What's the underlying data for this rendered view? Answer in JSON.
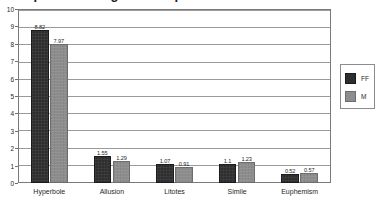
{
  "chart_data": {
    "type": "bar",
    "title": "Comparison of figures of speech",
    "categories": [
      "Hyperbole",
      "Allusion",
      "Litotes",
      "Simile",
      "Euphemism"
    ],
    "series": [
      {
        "name": "FF",
        "color": "#2e2e2e",
        "values": [
          8.82,
          1.55,
          1.07,
          1.1,
          0.52
        ]
      },
      {
        "name": "M",
        "color": "#8d8d8d",
        "values": [
          7.97,
          1.29,
          0.91,
          1.23,
          0.57
        ]
      }
    ],
    "value_labels": [
      [
        "8.82",
        "7.97"
      ],
      [
        "1.55",
        "1.29"
      ],
      [
        "1.07",
        "0.91"
      ],
      [
        "1.1",
        "1.23"
      ],
      [
        "0.52",
        "0.57"
      ]
    ],
    "xlabel": "",
    "ylabel": "",
    "ylim": [
      0,
      10
    ],
    "ytick_values": [
      0,
      1,
      2,
      3,
      4,
      5,
      6,
      7,
      8,
      9,
      10
    ],
    "ytick_labels": [
      "0",
      "1",
      "2",
      "3",
      "4",
      "5",
      "6",
      "7",
      "8",
      "9",
      "10"
    ],
    "grid": true,
    "legend_position": "right",
    "legend_entries": [
      "FF",
      "M"
    ],
    "plot_background": "#ffffff",
    "gridline_color": "#9a9a9a",
    "axis_color": "#7a7a7a"
  }
}
